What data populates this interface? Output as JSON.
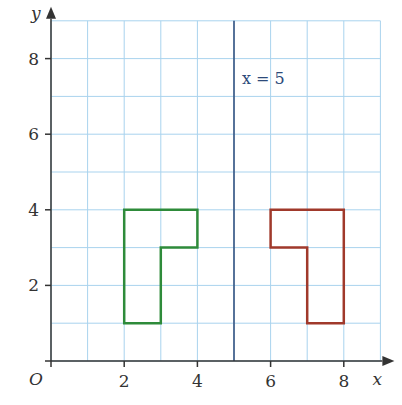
{
  "diagram": {
    "type": "reflection-grid",
    "axes": {
      "x_label": "x",
      "y_label": "y",
      "origin_label": "O",
      "x_ticks": [
        "2",
        "4",
        "6",
        "8"
      ],
      "y_ticks": [
        "2",
        "4",
        "6",
        "8"
      ],
      "x_range": [
        0,
        9
      ],
      "y_range": [
        0,
        9
      ]
    },
    "mirror_line": {
      "label": "x = 5",
      "x": 5,
      "color": "#2d4a7a"
    },
    "shapes": [
      {
        "name": "object",
        "color": "#2e8b3a",
        "points": [
          [
            2,
            1
          ],
          [
            2,
            4
          ],
          [
            4,
            4
          ],
          [
            4,
            3
          ],
          [
            3,
            3
          ],
          [
            3,
            1
          ]
        ]
      },
      {
        "name": "image",
        "color": "#a0392b",
        "points": [
          [
            6,
            4
          ],
          [
            8,
            4
          ],
          [
            8,
            1
          ],
          [
            7,
            1
          ],
          [
            7,
            3
          ],
          [
            6,
            3
          ]
        ]
      }
    ],
    "colors": {
      "grid": "#a9d3ee",
      "axis": "#333333"
    }
  }
}
